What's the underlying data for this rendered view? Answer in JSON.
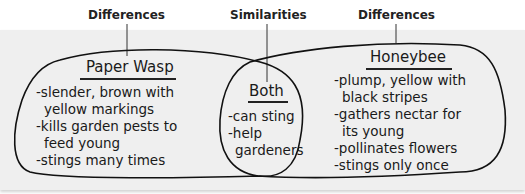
{
  "headers": {
    "left": "Differences",
    "center": "Similarities",
    "right": "Differences"
  },
  "venn": {
    "left": {
      "title": "Paper Wasp",
      "items": [
        "-slender, brown with",
        "yellow markings",
        "-kills garden pests to",
        "feed young",
        "-stings many times"
      ]
    },
    "center": {
      "title": "Both",
      "items": [
        "-can sting",
        "-help",
        "gardeners"
      ]
    },
    "right": {
      "title": "Honeybee",
      "items": [
        "-plump, yellow with",
        "black stripes",
        "-gathers nectar for",
        "its young",
        "-pollinates flowers",
        "-stings only once"
      ]
    }
  }
}
